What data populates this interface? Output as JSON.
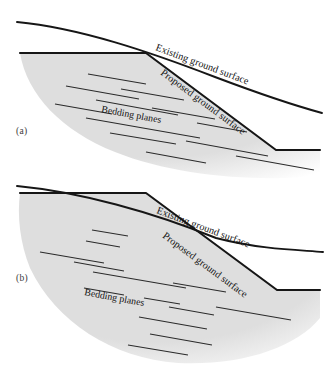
{
  "figure": {
    "kind": "geotechnical-slope-cross-section",
    "width": 336,
    "height": 377,
    "background_color": "#ffffff",
    "rock_fill_color": "#dedede",
    "line_color": "#161616",
    "bedding_color": "#2a2a2a"
  },
  "labels": {
    "existing_ground_surface": "Existing ground surface",
    "proposed_ground_surface": "Proposed ground surface",
    "bedding_planes": "Bedding planes",
    "panel_a": "(a)",
    "panel_b": "(b)"
  },
  "panels": [
    {
      "id": "a",
      "label": "(a)",
      "label_pos": {
        "x": 16,
        "y": 134
      },
      "existing_surface_path": "M 17,22 C 80,28 150,52 215,77 C 260,94 300,107 322,113",
      "proposed_surface_path": "M 20,53 L 146,53 L 276,150 L 320,150",
      "rock_mass_path": "M 20,53 L 146,53 L 276,150 L 320,150 L 320,176 C 255,182 175,176 115,152 C 62,131 27,95 20,53 Z",
      "mass_fade": {
        "cx": 0.44,
        "cy": 0.3,
        "r": 0.86,
        "inner_stop": 0.62,
        "outer_stop": 1.0
      },
      "annotations": [
        {
          "name": "existing-ground-surface-label",
          "text": "Existing ground surface",
          "x": 155,
          "y": 50,
          "rotate": 20.5
        },
        {
          "name": "proposed-ground-surface-label",
          "text": "Proposed ground surface",
          "x": 160,
          "y": 74,
          "rotate": 36.5
        },
        {
          "name": "bedding-planes-label",
          "text": "Bedding planes",
          "x": 101,
          "y": 112,
          "rotate": 10.5
        }
      ],
      "bedding_planes": [
        {
          "x1": 88,
          "y1": 74,
          "x2": 146,
          "y2": 84
        },
        {
          "x1": 66,
          "y1": 86,
          "x2": 139,
          "y2": 99
        },
        {
          "x1": 121,
          "y1": 89,
          "x2": 184,
          "y2": 100
        },
        {
          "x1": 96,
          "y1": 100,
          "x2": 178,
          "y2": 115
        },
        {
          "x1": 55,
          "y1": 104,
          "x2": 112,
          "y2": 114
        },
        {
          "x1": 152,
          "y1": 108,
          "x2": 215,
          "y2": 119
        },
        {
          "x1": 86,
          "y1": 118,
          "x2": 200,
          "y2": 138
        },
        {
          "x1": 197,
          "y1": 123,
          "x2": 247,
          "y2": 132
        },
        {
          "x1": 110,
          "y1": 133,
          "x2": 176,
          "y2": 144
        },
        {
          "x1": 186,
          "y1": 141,
          "x2": 268,
          "y2": 156
        },
        {
          "x1": 146,
          "y1": 152,
          "x2": 206,
          "y2": 163
        },
        {
          "x1": 236,
          "y1": 156,
          "x2": 314,
          "y2": 170
        }
      ]
    },
    {
      "id": "b",
      "label": "(b)",
      "label_pos": {
        "x": 16,
        "y": 281
      },
      "existing_surface_path": "M 17,186 C 80,192 152,212 216,238 C 262,250 302,250 323,252",
      "proposed_surface_path": "M 20,193 L 146,193 L 277,290 L 320,290",
      "rock_mass_path": "M 20,193 L 146,193 L 277,290 L 320,290 L 320,318 C 296,348 240,366 178,363 C 112,358 56,322 30,268 C 20,243 17,216 20,193 Z",
      "mass_fade": {
        "cx": 0.46,
        "cy": 0.28,
        "r": 0.9,
        "inner_stop": 0.66,
        "outer_stop": 1.0
      },
      "annotations": [
        {
          "name": "existing-ground-surface-label",
          "text": "Existing ground surface",
          "x": 156,
          "y": 213,
          "rotate": 20.5
        },
        {
          "name": "proposed-ground-surface-label",
          "text": "Proposed ground surface",
          "x": 162,
          "y": 237,
          "rotate": 36.5
        },
        {
          "name": "bedding-planes-label",
          "text": "Bedding planes",
          "x": 84,
          "y": 295,
          "rotate": 10.5
        }
      ],
      "bedding_planes": [
        {
          "x1": 92,
          "y1": 230,
          "x2": 128,
          "y2": 236
        },
        {
          "x1": 86,
          "y1": 241,
          "x2": 120,
          "y2": 247
        },
        {
          "x1": 40,
          "y1": 252,
          "x2": 104,
          "y2": 263
        },
        {
          "x1": 74,
          "y1": 262,
          "x2": 124,
          "y2": 271
        },
        {
          "x1": 93,
          "y1": 272,
          "x2": 186,
          "y2": 288
        },
        {
          "x1": 84,
          "y1": 288,
          "x2": 124,
          "y2": 295
        },
        {
          "x1": 173,
          "y1": 283,
          "x2": 226,
          "y2": 292
        },
        {
          "x1": 144,
          "y1": 298,
          "x2": 180,
          "y2": 304
        },
        {
          "x1": 169,
          "y1": 307,
          "x2": 214,
          "y2": 315
        },
        {
          "x1": 139,
          "y1": 317,
          "x2": 207,
          "y2": 329
        },
        {
          "x1": 216,
          "y1": 307,
          "x2": 291,
          "y2": 320
        },
        {
          "x1": 150,
          "y1": 334,
          "x2": 212,
          "y2": 345
        },
        {
          "x1": 128,
          "y1": 345,
          "x2": 188,
          "y2": 355
        }
      ]
    }
  ]
}
